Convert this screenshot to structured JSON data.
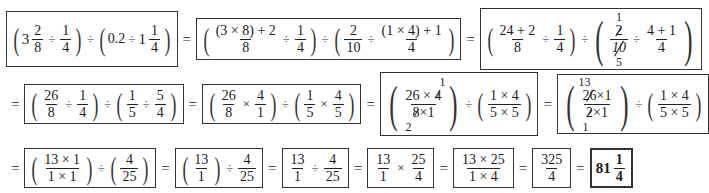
{
  "worksheet": {
    "line1": {
      "step1": {
        "group1": {
          "whole": "3",
          "num": "2",
          "den": "8",
          "op": "÷",
          "num2": "1",
          "den2": "4"
        },
        "between": "÷",
        "group2": {
          "decimal": "0.2",
          "op": "÷",
          "whole": "1",
          "num": "1",
          "den": "4"
        }
      },
      "eq1": "=",
      "step2": {
        "group1": {
          "num": "(3 × 8) + 2",
          "den": "8",
          "op": "÷",
          "num2": "1",
          "den2": "4"
        },
        "between": "÷",
        "group2": {
          "num": "2",
          "den": "10",
          "op": "÷",
          "num2": "(1 × 4) + 1",
          "den2": "4"
        }
      },
      "eq2": "=",
      "step3": {
        "group1": {
          "num": "24 + 2",
          "den": "8",
          "op": "÷",
          "num2": "1",
          "den2": "4"
        },
        "between": "÷",
        "group2": {
          "cancel_top": "1",
          "num": "2",
          "den": "10",
          "cancel_bottom": "5",
          "op": "÷",
          "num2": "4 + 1",
          "den2": "4"
        }
      }
    },
    "line2": {
      "eq0": "=",
      "step4": {
        "group1": {
          "num": "26",
          "den": "8",
          "op": "÷",
          "num2": "1",
          "den2": "4"
        },
        "between": "÷",
        "group2": {
          "num": "1",
          "den": "5",
          "op": "÷",
          "num2": "5",
          "den2": "4"
        }
      },
      "eq1": "=",
      "step5": {
        "group1": {
          "num": "26",
          "den": "8",
          "op": "×",
          "num2": "4",
          "den2": "1"
        },
        "between": "÷",
        "group2": {
          "num": "1",
          "den": "5",
          "op": "×",
          "num2": "4",
          "den2": "5"
        }
      },
      "eq2": "=",
      "step6": {
        "group1": {
          "cancel_top": "1",
          "num_a": "26",
          "num_op": "×",
          "num_b": "4",
          "den_a": "8",
          "den_op": "×",
          "den_b": "1",
          "cancel_bottom": "2"
        },
        "between": "÷",
        "group2": {
          "num": "1 × 4",
          "den": "5 × 5"
        }
      },
      "eq3": "=",
      "step7": {
        "group1": {
          "cancel_top": "13",
          "num_a": "26",
          "num_op": "×",
          "num_b": "1",
          "den_a": "2",
          "den_op": "×",
          "den_b": "1",
          "cancel_bottom": "1"
        },
        "between": "÷",
        "group2": {
          "num": "1 × 4",
          "den": "5 × 5"
        }
      }
    },
    "line3": {
      "eq0": "=",
      "step8": {
        "group1": {
          "num": "13 × 1",
          "den": "1 × 1"
        },
        "between": "÷",
        "group2": {
          "num": "4",
          "den": "25"
        }
      },
      "eq1": "=",
      "step9": {
        "group1": {
          "num": "13",
          "den": "1"
        },
        "op": "÷",
        "frac2": {
          "num": "4",
          "den": "25"
        }
      },
      "eq2": "=",
      "step10": {
        "num": "13",
        "den": "1",
        "op": "÷",
        "num2": "4",
        "den2": "25"
      },
      "eq3": "=",
      "step11": {
        "num": "13",
        "den": "1",
        "op": "×",
        "num2": "25",
        "den2": "4"
      },
      "eq4": "=",
      "step12": {
        "num": "13 × 25",
        "den": "1 × 4"
      },
      "eq5": "=",
      "step13": {
        "num": "325",
        "den": "4"
      },
      "eq6": "=",
      "answer": {
        "whole": "81",
        "num": "1",
        "den": "4"
      }
    }
  }
}
